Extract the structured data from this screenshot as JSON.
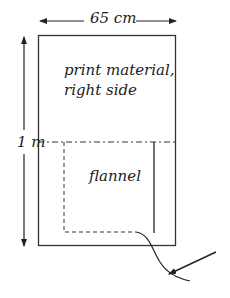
{
  "diagram": {
    "width_dimension": "65 cm",
    "height_dimension": "1 m",
    "outer_panel": {
      "label_line1": "print material,",
      "label_line2": "right side"
    },
    "inner_panel": {
      "label": "flannel"
    },
    "colors": {
      "line": "#333333",
      "background": "#ffffff"
    }
  }
}
